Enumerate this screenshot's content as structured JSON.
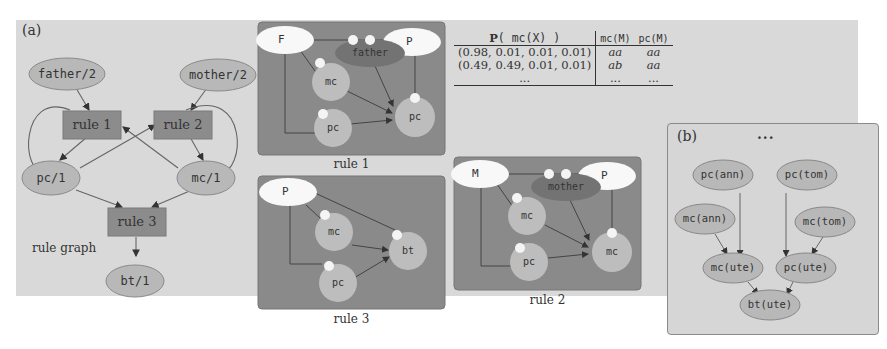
{
  "panel_a": {
    "label": "(a)",
    "rule_graph": {
      "caption": "rule graph",
      "predicates": [
        {
          "id": "father",
          "label": "father/2"
        },
        {
          "id": "mother",
          "label": "mother/2"
        },
        {
          "id": "pc",
          "label": "pc/1"
        },
        {
          "id": "mc",
          "label": "mc/1"
        },
        {
          "id": "bt",
          "label": "bt/1"
        }
      ],
      "rules": [
        {
          "id": "rule1",
          "label": "rule 1"
        },
        {
          "id": "rule2",
          "label": "rule 2"
        },
        {
          "id": "rule3",
          "label": "rule 3"
        }
      ]
    },
    "rule_networks": [
      {
        "caption": "rule 1",
        "vars": [
          "F",
          "P"
        ],
        "relation": "father",
        "nodes": [
          "mc",
          "pc",
          "pc"
        ]
      },
      {
        "caption": "rule 3",
        "vars": [
          "P"
        ],
        "relation": "",
        "nodes": [
          "mc",
          "pc",
          "bt"
        ]
      },
      {
        "caption": "rule 2",
        "vars": [
          "M",
          "P"
        ],
        "relation": "mother",
        "nodes": [
          "mc",
          "pc",
          "mc"
        ]
      }
    ],
    "table": {
      "headers": [
        "P( mc(X) )",
        "mc(M)",
        "pc(M)"
      ],
      "header_prefix_bold": "P",
      "header_rest": "( mc(X) )",
      "rows": [
        [
          "(0.98, 0.01, 0.01, 0.01)",
          "aa",
          "aa"
        ],
        [
          "(0.49, 0.49, 0.01, 0.01)",
          "ab",
          "aa"
        ],
        [
          "...",
          "...",
          "..."
        ]
      ]
    }
  },
  "panel_b": {
    "label": "(b)",
    "ellipsis": "...",
    "nodes": [
      {
        "id": "pc_ann",
        "label": "pc(ann)"
      },
      {
        "id": "pc_tom",
        "label": "pc(tom)"
      },
      {
        "id": "mc_ann",
        "label": "mc(ann)"
      },
      {
        "id": "mc_tom",
        "label": "mc(tom)"
      },
      {
        "id": "mc_ute",
        "label": "mc(ute)"
      },
      {
        "id": "pc_ute",
        "label": "pc(ute)"
      },
      {
        "id": "bt_ute",
        "label": "bt(ute)"
      }
    ]
  },
  "colors": {
    "panel_bg": "#d9d9d9",
    "rule_box": "#8c8c8c",
    "predicate_node": "#b8b8b8",
    "network_bg": "#8a8a8a",
    "network_node": "#bdbdbd",
    "var_node": "#f8f8f8",
    "relation_node": "#737373",
    "edge": "#555555"
  }
}
